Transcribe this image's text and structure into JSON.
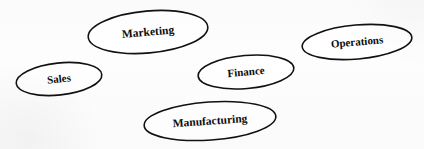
{
  "diagram": {
    "type": "node-cluster",
    "background_color": "#fdfdfd",
    "stroke_color": "#111111",
    "fill_color": "#ffffff",
    "text_color": "#0d0d0d",
    "width": 424,
    "height": 149,
    "nodes": [
      {
        "id": "marketing",
        "label": "Marketing",
        "shape": "ellipse",
        "cx": 148,
        "cy": 32,
        "rx": 60,
        "ry": 21,
        "rotation": -5,
        "font_size": 11.5
      },
      {
        "id": "sales",
        "label": "Sales",
        "shape": "ellipse",
        "cx": 59,
        "cy": 79,
        "rx": 43,
        "ry": 16,
        "rotation": -6,
        "font_size": 11
      },
      {
        "id": "finance",
        "label": "Finance",
        "shape": "ellipse",
        "cx": 246,
        "cy": 72,
        "rx": 48,
        "ry": 16.5,
        "rotation": -5,
        "font_size": 11
      },
      {
        "id": "operations",
        "label": "Operations",
        "shape": "ellipse",
        "cx": 357,
        "cy": 42,
        "rx": 55,
        "ry": 17,
        "rotation": -5,
        "font_size": 11
      },
      {
        "id": "manufacturing",
        "label": "Manufacturing",
        "shape": "ellipse",
        "cx": 210,
        "cy": 121,
        "rx": 66,
        "ry": 19,
        "rotation": -4,
        "font_size": 11.5
      }
    ]
  }
}
